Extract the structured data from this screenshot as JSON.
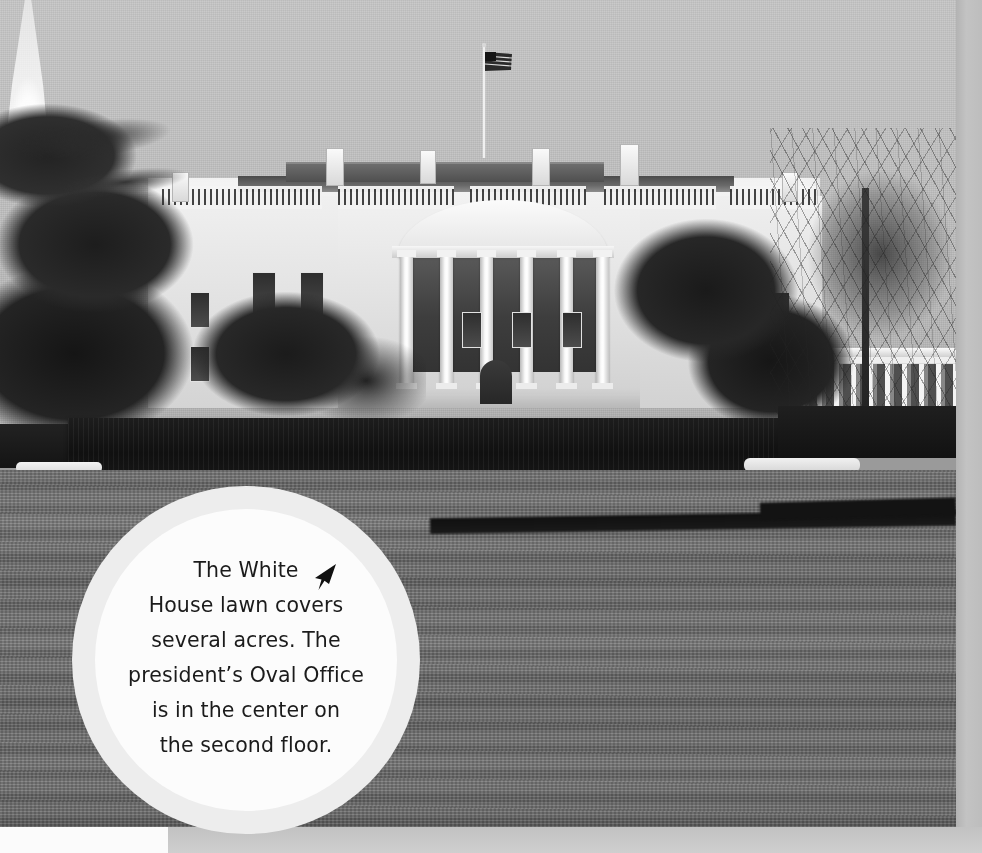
{
  "page": {
    "kind": "photograph-with-caption-callout",
    "width": 982,
    "height": 853,
    "rendering": "black-and-white photograph"
  },
  "photo": {
    "subject": "The White House, South Lawn view",
    "elements": {
      "flag": "american-flag-on-rooftop-pole",
      "building": "white-house-south-portico",
      "columns_count": 6,
      "fountain": "south-lawn-fountain",
      "hedge": "trimmed-hedge-row",
      "lawn": "south-lawn-grass",
      "trees_left": "large-evergreen-tree",
      "trees_right": "bare-deciduous-tree",
      "west_wing": "colonnade-wing-right"
    }
  },
  "callout": {
    "icon": "pointer-arrow-icon",
    "text_lines": [
      "The White",
      "House lawn covers",
      "several acres. The",
      "president’s Oval Office",
      "is in the center on",
      "the second floor."
    ],
    "full_text": "The White House lawn covers several acres. The president’s Oval Office is in the center on the second floor."
  },
  "colors": {
    "callout_outer_ring": "#ededed",
    "callout_inner": "#fcfcfc",
    "callout_text": "#1b1b1b",
    "page_margin": "#c3c3c3",
    "sky": "#c2c2c2",
    "lawn": "#6f6f6f",
    "hedge": "#141414",
    "building": "#ededed"
  }
}
